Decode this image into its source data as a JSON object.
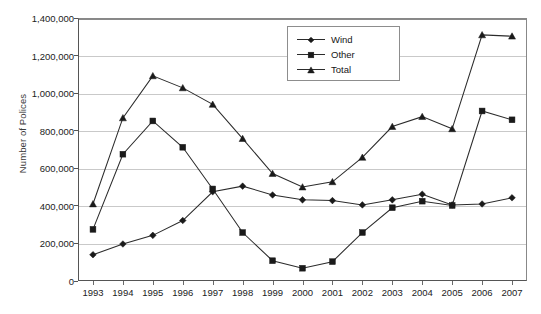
{
  "chart_data": {
    "type": "line",
    "title": "",
    "xlabel": "",
    "ylabel": "Number of Polices",
    "categories": [
      1993,
      1994,
      1995,
      1996,
      1997,
      1998,
      1999,
      2000,
      2001,
      2002,
      2003,
      2004,
      2005,
      2006,
      2007
    ],
    "xtick_labels": [
      "1993",
      "1994",
      "1995",
      "1996",
      "1997",
      "1998",
      "1999",
      "2000",
      "2001",
      "2002",
      "2003",
      "2004",
      "2005",
      "2006",
      "2007"
    ],
    "ylim": [
      0,
      1400000
    ],
    "ytick_labels": [
      "0",
      "200,000",
      "400,000",
      "600,000",
      "800,000",
      "1,000,000",
      "1,200,000",
      "1,400,000"
    ],
    "ytick_values": [
      0,
      200000,
      400000,
      600000,
      800000,
      1000000,
      1200000,
      1400000
    ],
    "grid": true,
    "legend_position": "top-center",
    "series": [
      {
        "name": "Wind",
        "marker": "diamond",
        "values": [
          140000,
          197000,
          243000,
          322000,
          475000,
          505000,
          458000,
          432000,
          428000,
          405000,
          432000,
          462000,
          405000,
          410000,
          443000
        ]
      },
      {
        "name": "Other",
        "marker": "square",
        "values": [
          275000,
          675000,
          852000,
          712000,
          490000,
          258000,
          108000,
          68000,
          103000,
          258000,
          390000,
          425000,
          402000,
          905000,
          858000
        ]
      },
      {
        "name": "Total",
        "marker": "triangle",
        "values": [
          410000,
          868000,
          1092000,
          1028000,
          940000,
          758000,
          572000,
          500000,
          528000,
          658000,
          822000,
          875000,
          810000,
          1310000,
          1303000
        ]
      }
    ]
  },
  "legend": {
    "items": [
      {
        "label": "Wind",
        "marker": "diamond"
      },
      {
        "label": "Other",
        "marker": "square"
      },
      {
        "label": "Total",
        "marker": "triangle"
      }
    ]
  },
  "axis": {
    "y_title": "Number of Polices"
  }
}
